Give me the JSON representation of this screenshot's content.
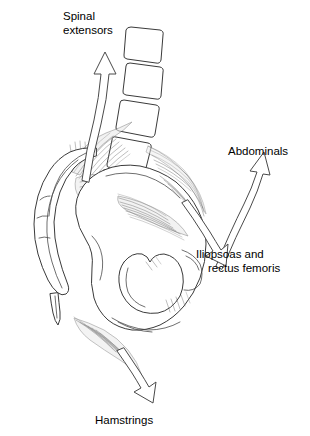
{
  "figure": {
    "background_color": "#ffffff",
    "line_color": "#3a3a3a",
    "text_color": "#000000",
    "width": 310,
    "height": 436
  },
  "labels": {
    "spinal_extensors_line1": "Spinal",
    "spinal_extensors_line2": "extensors",
    "abdominals": "Abdominals",
    "iliopsoas_line1": "Iliopsoas and",
    "iliopsoas_line2": "rectus femoris",
    "hamstrings": "Hamstrings"
  },
  "anatomy": {
    "vertebrae_count": 4,
    "structures": [
      "lumbar-vertebrae",
      "sacrum",
      "coccyx",
      "ilium",
      "obturator-foramen",
      "pubis",
      "ischium"
    ]
  },
  "arrows": [
    {
      "name": "spinal-extensors-arrow",
      "direction": "up"
    },
    {
      "name": "abdominals-arrow",
      "direction": "up-right"
    },
    {
      "name": "iliopsoas-arrow",
      "direction": "down-right"
    },
    {
      "name": "hamstrings-arrow",
      "direction": "down"
    }
  ]
}
